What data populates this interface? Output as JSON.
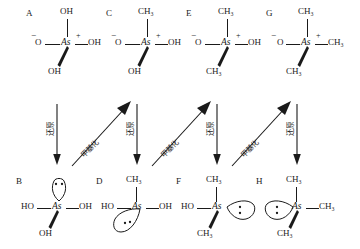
{
  "diagram": {
    "center_atom": "As",
    "charge_plus": "+",
    "charge_minus": "−",
    "ink_color": "#1a1a1a",
    "background_color": "#ffffff"
  },
  "structures": [
    {
      "tag": "A",
      "row": "top",
      "center": "As",
      "charge": "+",
      "top": "OH",
      "left": "O",
      "left_charge": "−",
      "right": "OH",
      "wedge": "OH",
      "lone_pair": false
    },
    {
      "tag": "C",
      "row": "top",
      "center": "As",
      "charge": "+",
      "top": "CH₃",
      "left": "O",
      "left_charge": "−",
      "right": "OH",
      "wedge": "OH",
      "lone_pair": false
    },
    {
      "tag": "E",
      "row": "top",
      "center": "As",
      "charge": "+",
      "top": "CH₃",
      "left": "O",
      "left_charge": "−",
      "right": "OH",
      "wedge": "CH₃",
      "lone_pair": false
    },
    {
      "tag": "G",
      "row": "top",
      "center": "As",
      "charge": "+",
      "top": "CH₃",
      "left": "O",
      "left_charge": "−",
      "right": "CH₃",
      "wedge": "CH₃",
      "lone_pair": false
    },
    {
      "tag": "B",
      "row": "bottom",
      "center": "As",
      "charge": "",
      "top": "",
      "left": "HO",
      "left_charge": "",
      "right": "OH",
      "wedge": "OH",
      "lone_pair": true,
      "lone_pair_position": "top"
    },
    {
      "tag": "D",
      "row": "bottom",
      "center": "As",
      "charge": "",
      "top": "CH₃",
      "left": "HO",
      "left_charge": "",
      "right": "OH",
      "wedge": "",
      "lone_pair": true,
      "lone_pair_position": "bottom-left"
    },
    {
      "tag": "F",
      "row": "bottom",
      "center": "As",
      "charge": "",
      "top": "CH₃",
      "left": "HO",
      "left_charge": "",
      "right": "",
      "wedge": "CH₃",
      "lone_pair": true,
      "lone_pair_position": "right"
    },
    {
      "tag": "H",
      "row": "bottom",
      "center": "As",
      "charge": "",
      "top": "CH₃",
      "left": "",
      "left_charge": "",
      "right": "CH₃",
      "wedge": "CH₃",
      "lone_pair": true,
      "lone_pair_position": "left"
    }
  ],
  "arrows": [
    {
      "id": "red-1",
      "type": "reduction",
      "label": "还原",
      "direction": "down",
      "from": "A",
      "to": "B"
    },
    {
      "id": "meth-1",
      "type": "methylation",
      "label": "甲基化",
      "direction": "up-right",
      "from": "B",
      "to": "C"
    },
    {
      "id": "red-2",
      "type": "reduction",
      "label": "还原",
      "direction": "down",
      "from": "C",
      "to": "D"
    },
    {
      "id": "meth-2",
      "type": "methylation",
      "label": "甲基化",
      "direction": "up-right",
      "from": "D",
      "to": "E"
    },
    {
      "id": "red-3",
      "type": "reduction",
      "label": "还原",
      "direction": "down",
      "from": "E",
      "to": "F"
    },
    {
      "id": "meth-3",
      "type": "methylation",
      "label": "甲基化",
      "direction": "up-right",
      "from": "F",
      "to": "G"
    },
    {
      "id": "red-4",
      "type": "reduction",
      "label": "还原",
      "direction": "down",
      "from": "G",
      "to": "H"
    }
  ]
}
